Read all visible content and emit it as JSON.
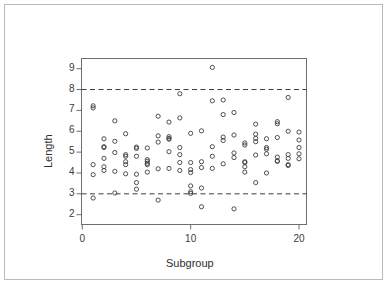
{
  "chart_data": {
    "type": "scatter",
    "title": "",
    "subtitle": "",
    "xlabel": "Subgroup",
    "ylabel": "Length",
    "xlim": [
      0,
      20.8
    ],
    "ylim": [
      1.85,
      9.35
    ],
    "xticks": [
      0,
      10,
      20
    ],
    "xtick_labels": [
      "0",
      "10",
      "20"
    ],
    "yticks": [
      2,
      3,
      4,
      5,
      6,
      7,
      8,
      9
    ],
    "ytick_labels": [
      "2",
      "3",
      "4",
      "5",
      "6",
      "7",
      "8",
      "9"
    ],
    "grid": false,
    "legend": null,
    "marker": "open-circle",
    "marker_color": "#3d3d3d",
    "marker_size": 4.2,
    "annotations": [
      {
        "type": "hline",
        "y": 8.0,
        "style": "dashed",
        "color": "#3d3d3d",
        "label": "upper control limit"
      },
      {
        "type": "hline",
        "y": 3.0,
        "style": "dashed",
        "color": "#3d3d3d",
        "label": "lower control limit"
      }
    ],
    "points": [
      {
        "x": 1,
        "y": 7.22
      },
      {
        "x": 1,
        "y": 7.12
      },
      {
        "x": 1,
        "y": 4.4
      },
      {
        "x": 1,
        "y": 3.92
      },
      {
        "x": 1,
        "y": 2.8
      },
      {
        "x": 2,
        "y": 5.64
      },
      {
        "x": 2,
        "y": 5.26
      },
      {
        "x": 2,
        "y": 5.22
      },
      {
        "x": 2,
        "y": 4.7
      },
      {
        "x": 2,
        "y": 4.3
      },
      {
        "x": 2,
        "y": 4.12
      },
      {
        "x": 3,
        "y": 6.5
      },
      {
        "x": 3,
        "y": 5.52
      },
      {
        "x": 3,
        "y": 4.98
      },
      {
        "x": 3,
        "y": 4.08
      },
      {
        "x": 3,
        "y": 3.04
      },
      {
        "x": 4,
        "y": 5.88
      },
      {
        "x": 4,
        "y": 4.88
      },
      {
        "x": 4,
        "y": 4.8
      },
      {
        "x": 4,
        "y": 4.54
      },
      {
        "x": 4,
        "y": 4.4
      },
      {
        "x": 4,
        "y": 3.96
      },
      {
        "x": 5,
        "y": 5.24
      },
      {
        "x": 5,
        "y": 5.18
      },
      {
        "x": 5,
        "y": 4.8
      },
      {
        "x": 5,
        "y": 3.94
      },
      {
        "x": 5,
        "y": 3.54
      },
      {
        "x": 5,
        "y": 3.22
      },
      {
        "x": 6,
        "y": 5.2
      },
      {
        "x": 6,
        "y": 4.64
      },
      {
        "x": 6,
        "y": 4.56
      },
      {
        "x": 6,
        "y": 4.46
      },
      {
        "x": 6,
        "y": 4.4
      },
      {
        "x": 6,
        "y": 4.04
      },
      {
        "x": 7,
        "y": 6.72
      },
      {
        "x": 7,
        "y": 5.78
      },
      {
        "x": 7,
        "y": 5.48
      },
      {
        "x": 7,
        "y": 4.2
      },
      {
        "x": 7,
        "y": 2.7
      },
      {
        "x": 8,
        "y": 6.44
      },
      {
        "x": 8,
        "y": 5.74
      },
      {
        "x": 8,
        "y": 5.66
      },
      {
        "x": 8,
        "y": 5.62
      },
      {
        "x": 8,
        "y": 5.02
      },
      {
        "x": 8,
        "y": 4.22
      },
      {
        "x": 9,
        "y": 7.8
      },
      {
        "x": 9,
        "y": 6.64
      },
      {
        "x": 9,
        "y": 5.22
      },
      {
        "x": 9,
        "y": 4.88
      },
      {
        "x": 9,
        "y": 4.5
      },
      {
        "x": 9,
        "y": 4.12
      },
      {
        "x": 10,
        "y": 5.9
      },
      {
        "x": 10,
        "y": 4.5
      },
      {
        "x": 10,
        "y": 4.16
      },
      {
        "x": 10,
        "y": 4.02
      },
      {
        "x": 10,
        "y": 3.38
      },
      {
        "x": 10,
        "y": 3.1
      },
      {
        "x": 10,
        "y": 3.02
      },
      {
        "x": 11,
        "y": 6.02
      },
      {
        "x": 11,
        "y": 4.54
      },
      {
        "x": 11,
        "y": 4.26
      },
      {
        "x": 11,
        "y": 3.28
      },
      {
        "x": 11,
        "y": 2.38
      },
      {
        "x": 12,
        "y": 9.06
      },
      {
        "x": 12,
        "y": 7.46
      },
      {
        "x": 12,
        "y": 5.26
      },
      {
        "x": 12,
        "y": 4.8
      },
      {
        "x": 12,
        "y": 4.22
      },
      {
        "x": 13,
        "y": 7.5
      },
      {
        "x": 13,
        "y": 6.8
      },
      {
        "x": 13,
        "y": 5.72
      },
      {
        "x": 13,
        "y": 5.56
      },
      {
        "x": 13,
        "y": 4.44
      },
      {
        "x": 14,
        "y": 6.9
      },
      {
        "x": 14,
        "y": 5.82
      },
      {
        "x": 14,
        "y": 4.96
      },
      {
        "x": 14,
        "y": 4.74
      },
      {
        "x": 14,
        "y": 2.28
      },
      {
        "x": 15,
        "y": 5.44
      },
      {
        "x": 15,
        "y": 5.34
      },
      {
        "x": 15,
        "y": 4.54
      },
      {
        "x": 15,
        "y": 4.5
      },
      {
        "x": 15,
        "y": 4.3
      },
      {
        "x": 15,
        "y": 4.04
      },
      {
        "x": 16,
        "y": 6.34
      },
      {
        "x": 16,
        "y": 5.86
      },
      {
        "x": 16,
        "y": 5.66
      },
      {
        "x": 16,
        "y": 5.5
      },
      {
        "x": 16,
        "y": 4.86
      },
      {
        "x": 16,
        "y": 3.54
      },
      {
        "x": 17,
        "y": 5.64
      },
      {
        "x": 17,
        "y": 5.22
      },
      {
        "x": 17,
        "y": 5.14
      },
      {
        "x": 17,
        "y": 4.92
      },
      {
        "x": 17,
        "y": 4.0
      },
      {
        "x": 18,
        "y": 6.46
      },
      {
        "x": 18,
        "y": 6.36
      },
      {
        "x": 18,
        "y": 5.7
      },
      {
        "x": 18,
        "y": 4.76
      },
      {
        "x": 18,
        "y": 4.58
      },
      {
        "x": 18,
        "y": 4.56
      },
      {
        "x": 19,
        "y": 7.62
      },
      {
        "x": 19,
        "y": 6.0
      },
      {
        "x": 19,
        "y": 4.88
      },
      {
        "x": 19,
        "y": 4.7
      },
      {
        "x": 19,
        "y": 4.4
      },
      {
        "x": 19,
        "y": 4.36
      },
      {
        "x": 20,
        "y": 5.96
      },
      {
        "x": 20,
        "y": 5.58
      },
      {
        "x": 20,
        "y": 5.22
      },
      {
        "x": 20,
        "y": 4.92
      },
      {
        "x": 20,
        "y": 4.68
      }
    ]
  },
  "axes": {
    "x_title": "Subgroup",
    "y_title": "Length"
  }
}
